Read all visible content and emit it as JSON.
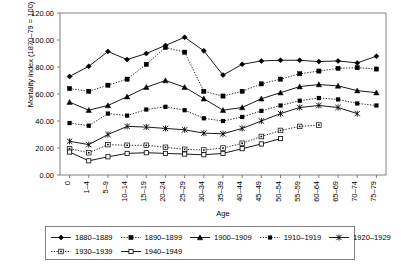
{
  "chart_data": {
    "type": "line",
    "title": "",
    "xlabel": "Age",
    "ylabel": "Mortality index (1870–79 = 100)",
    "ylim": [
      0,
      120
    ],
    "ytick_step": 20,
    "ytick_labels": [
      "0.00",
      "20.00",
      "40.00",
      "60.00",
      "80.00",
      "100.00",
      "120.00"
    ],
    "grid": false,
    "legend_position": "bottom",
    "categories": [
      "0",
      "1–4",
      "5–9",
      "10–14",
      "15–19",
      "20–24",
      "25–29",
      "30–34",
      "35–39",
      "40–44",
      "45–49",
      "50–54",
      "55–59",
      "60–64",
      "65–69",
      "70–74",
      "75–79"
    ],
    "series": [
      {
        "name": "1880–1889",
        "marker": "diamond",
        "dash": "solid",
        "values": [
          73,
          80.5,
          91.5,
          85.5,
          90,
          96,
          102,
          92,
          74,
          82,
          84.5,
          85,
          85,
          84,
          84.5,
          83,
          88
        ]
      },
      {
        "name": "1890–1899",
        "marker": "square",
        "dash": "dotted",
        "values": [
          64,
          62,
          66.5,
          71,
          82,
          94.5,
          91,
          62,
          58.5,
          62,
          67.5,
          71,
          75,
          77,
          79,
          79.5,
          78.5
        ]
      },
      {
        "name": "1900–1909",
        "marker": "triangle",
        "dash": "solid",
        "values": [
          54,
          48,
          51.5,
          58,
          65,
          70,
          65,
          56.5,
          48,
          50,
          56.5,
          61,
          65.5,
          67,
          66,
          62.5,
          61
        ]
      },
      {
        "name": "1910–1919",
        "marker": "x-square",
        "dash": "dotted",
        "values": [
          38.5,
          36.5,
          45.5,
          44,
          48.5,
          50.5,
          48,
          42,
          40,
          43,
          47.5,
          51.5,
          55,
          57,
          56,
          53,
          51.5
        ]
      },
      {
        "name": "1920–1929",
        "marker": "star",
        "dash": "solid",
        "values": [
          25,
          22.5,
          30,
          36,
          35.5,
          34.5,
          33.5,
          31,
          30.5,
          34.5,
          40,
          45.5,
          50,
          51.5,
          50,
          45.5,
          null
        ]
      },
      {
        "name": "1930–1939",
        "marker": "dot-square",
        "dash": "dotted",
        "values": [
          19.5,
          16.5,
          22.5,
          22,
          22,
          20.5,
          19,
          18.5,
          20,
          23.5,
          28.5,
          33,
          36,
          37,
          null,
          null,
          null
        ]
      },
      {
        "name": "1940–1949",
        "marker": "open-square",
        "dash": "solid",
        "values": [
          17,
          10.5,
          13.5,
          16,
          16.5,
          16,
          15.5,
          15,
          16,
          19.5,
          23,
          27,
          null,
          null,
          null,
          null,
          null
        ]
      }
    ]
  },
  "axes": {
    "y_title": "Mortality index (1870–79 = 100)",
    "x_title": "Age"
  },
  "legend": {
    "row1": [
      {
        "label": "1880–1889"
      },
      {
        "label": "1890–1899"
      },
      {
        "label": "1900–1909"
      },
      {
        "label": "1910–1919"
      },
      {
        "label": "1920–1929"
      }
    ],
    "row2": [
      {
        "label": "1930–1939"
      },
      {
        "label": "1940–1949"
      }
    ]
  },
  "colors": {
    "line": "#000000",
    "axis": "#808080",
    "text": "#000000",
    "background": "#ffffff"
  }
}
